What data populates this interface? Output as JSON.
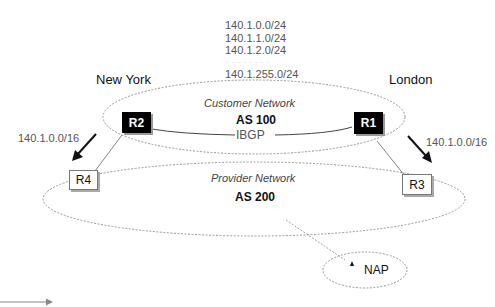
{
  "prefixes": {
    "list": [
      "140.1.0.0/24",
      "140.1.1.0/24",
      "140.1.2.0/24"
    ],
    "ellipsis": ". . . . . . . .",
    "last": "140.1.255.0/24"
  },
  "cities": {
    "left": "New York",
    "right": "London"
  },
  "customer_network": {
    "name": "Customer Network",
    "as": "AS 100",
    "link_label": "IBGP"
  },
  "provider_network": {
    "name": "Provider Network",
    "as": "AS 200"
  },
  "routers": {
    "r1": "R1",
    "r2": "R2",
    "r3": "R3",
    "r4": "R4"
  },
  "announcements": {
    "left": "140.1.0.0/16",
    "right": "140.1.0.0/16"
  },
  "nap": {
    "label": "NAP"
  },
  "colors": {
    "dashed_line": "#888888",
    "router_dark": "#000000",
    "arrow": "#111111",
    "legend_arrow": "#888888"
  }
}
